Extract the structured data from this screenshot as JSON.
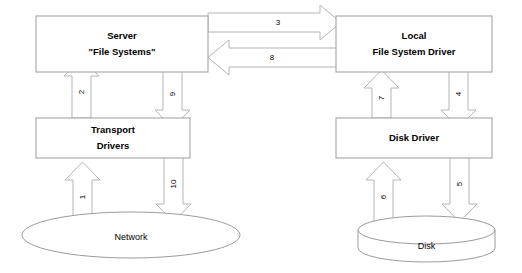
{
  "diagram": {
    "colors": {
      "background": "#ffffff",
      "shape_stroke": "#9b9b9b",
      "arrow_stroke": "#b5b5b5",
      "text": "#000000"
    },
    "nodes": {
      "server": {
        "line1": "Server",
        "line2": "\"File Systems\""
      },
      "local_fs_driver": {
        "line1": "Local",
        "line2": "File System Driver"
      },
      "transport_drivers": {
        "line1": "Transport",
        "line2": "Drivers"
      },
      "disk_driver": {
        "line1": "Disk Driver"
      },
      "network": {
        "label": "Network"
      },
      "disk": {
        "label": "Disk"
      }
    },
    "arrows": {
      "a1": {
        "label": "1",
        "direction": "up",
        "from": "network",
        "to": "transport-drivers"
      },
      "a2": {
        "label": "2",
        "direction": "up",
        "from": "transport-drivers",
        "to": "server"
      },
      "a3": {
        "label": "3",
        "direction": "right",
        "from": "server",
        "to": "local-file-system-driver"
      },
      "a4": {
        "label": "4",
        "direction": "down",
        "from": "local-file-system-driver",
        "to": "disk-driver"
      },
      "a5": {
        "label": "5",
        "direction": "down",
        "from": "disk-driver",
        "to": "disk"
      },
      "a6": {
        "label": "6",
        "direction": "up",
        "from": "disk",
        "to": "disk-driver"
      },
      "a7": {
        "label": "7",
        "direction": "up",
        "from": "disk-driver",
        "to": "local-file-system-driver"
      },
      "a8": {
        "label": "8",
        "direction": "left",
        "from": "local-file-system-driver",
        "to": "server"
      },
      "a9": {
        "label": "9",
        "direction": "down",
        "from": "server",
        "to": "transport-drivers"
      },
      "a10": {
        "label": "10",
        "direction": "down",
        "from": "transport-drivers",
        "to": "network"
      }
    }
  }
}
